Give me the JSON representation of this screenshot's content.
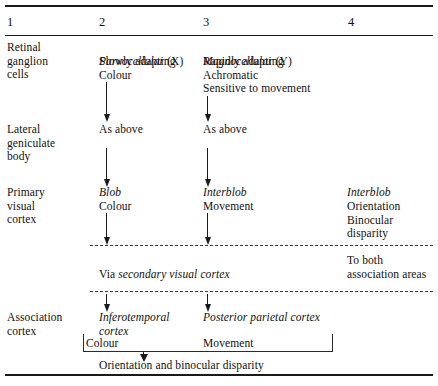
{
  "figure": {
    "columns": [
      "1",
      "2",
      "3",
      "4"
    ]
  },
  "stages": {
    "retinal_ganglion_cells": "Retinal\nganglion\ncells",
    "lateral_geniculate_body": "Lateral\ngeniculate\nbody",
    "primary_visual_cortex": "Primary\nvisual\ncortex",
    "association_cortex": "Association\ncortex"
  },
  "row_retina": {
    "col2_italic": "Parvocellular",
    "col2_roman": " (X)",
    "col2_lines": "Slowly adapting\nColour",
    "col3_italic": "Magnocellular",
    "col3_roman": " (Y)",
    "col3_lines": "Rapidly adapting\nAchromatic\nSensitive to movement"
  },
  "row_lgb": {
    "col2": "As above",
    "col3": "As above"
  },
  "row_v1": {
    "col2_italic": "Blob",
    "col2_lines": "Colour",
    "col3_italic": "Interblob",
    "col3_lines": "Movement",
    "col4_italic": "Interblob",
    "col4_lines": "Orientation\nBinocular\ndisparity"
  },
  "row_via": {
    "prefix": "Via ",
    "italic": "secondary visual cortex",
    "col4": "To both\nassociation areas"
  },
  "row_association": {
    "col2_italic": "Inferotemporal\ncortex",
    "col2_label": "Colour",
    "col3_italic": "Posterior parietal cortex",
    "col3_label": "Movement",
    "summary": "Orientation and binocular disparity"
  },
  "colors": {
    "ink": "#111111",
    "rule": "#1a1a1a",
    "dash": "#3a3a3a",
    "background": "#ffffff"
  }
}
